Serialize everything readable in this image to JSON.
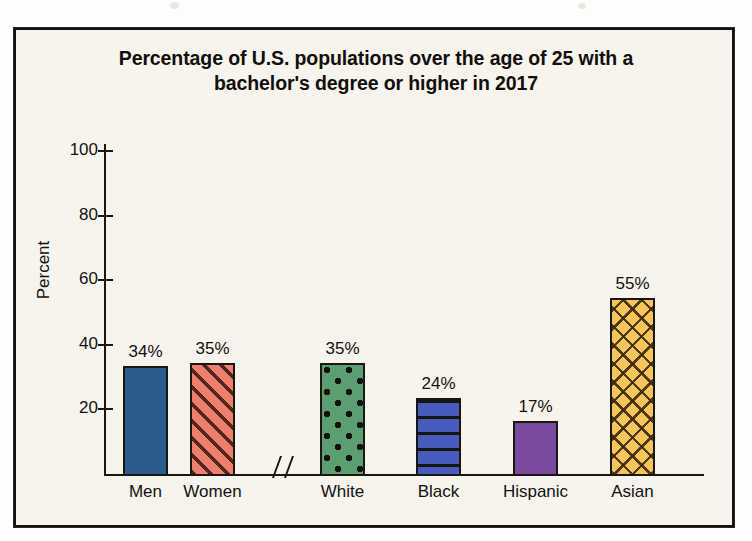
{
  "figure": {
    "title_line1": "Percentage of U.S. populations over the age of 25 with a",
    "title_line2": "bachelor's degree or higher in 2017",
    "axis_break_marker": "//",
    "background_color": "#f6f4ed",
    "border_color": "#15130f"
  },
  "chart_data": {
    "type": "bar",
    "title": "Percentage of U.S. populations over the age of 25 with a bachelor's degree or higher in 2017",
    "xlabel": "",
    "ylabel": "Percent",
    "ylim": [
      0,
      110
    ],
    "yticks": [
      20,
      40,
      60,
      80,
      100
    ],
    "ytick_labels": [
      "20",
      "40",
      "60",
      "80",
      "100"
    ],
    "grid": false,
    "legend": false,
    "axis_break_after_category": "Women",
    "categories": [
      "Men",
      "Women",
      "White",
      "Black",
      "Hispanic",
      "Asian"
    ],
    "values": [
      34,
      35,
      35,
      24,
      17,
      55
    ],
    "value_labels": [
      "34%",
      "35%",
      "35%",
      "24%",
      "17%",
      "55%"
    ],
    "bars": [
      {
        "category": "Men",
        "value": 34,
        "label": "34%",
        "color": "#2b5c8a",
        "pattern": "solid",
        "left": 107,
        "width": 45
      },
      {
        "category": "Women",
        "value": 35,
        "label": "35%",
        "color": "#ee7f6f",
        "pattern": "diagonal",
        "left": 174,
        "width": 45
      },
      {
        "category": "White",
        "value": 35,
        "label": "35%",
        "color": "#5b9e72",
        "pattern": "dots",
        "left": 304,
        "width": 45
      },
      {
        "category": "Black",
        "value": 24,
        "label": "24%",
        "color": "#4a5bbf",
        "pattern": "hlines",
        "left": 400,
        "width": 45
      },
      {
        "category": "Hispanic",
        "value": 17,
        "label": "17%",
        "color": "#7a4a9c",
        "pattern": "solid",
        "left": 497,
        "width": 45
      },
      {
        "category": "Asian",
        "value": 55,
        "label": "55%",
        "color": "#f5c55c",
        "pattern": "crosshatch",
        "left": 594,
        "width": 45
      }
    ]
  }
}
